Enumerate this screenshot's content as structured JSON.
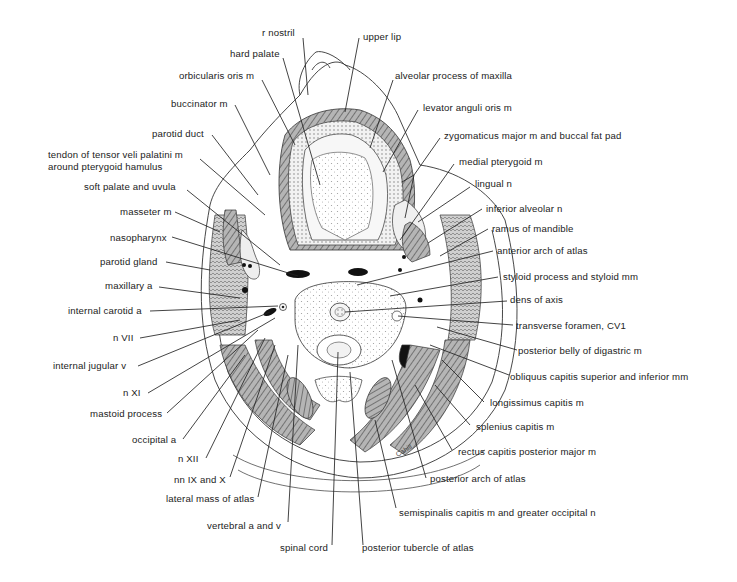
{
  "figure": {
    "signature": "Cahill",
    "colors": {
      "ink": "#222222",
      "background": "#ffffff",
      "muscle_shading": "#8a8a8a",
      "bone_stipple": "#bdbdbd"
    }
  },
  "labels": {
    "left": [
      {
        "text": "r nostril"
      },
      {
        "text": "hard palate"
      },
      {
        "text": "orbicularis oris m"
      },
      {
        "text": "buccinator m"
      },
      {
        "text": "parotid duct"
      },
      {
        "text": "tendon of tensor veli palatini m"
      },
      {
        "text": "around pterygoid hamulus"
      },
      {
        "text": "soft palate and uvula"
      },
      {
        "text": "masseter m"
      },
      {
        "text": "nasopharynx"
      },
      {
        "text": "parotid gland"
      },
      {
        "text": "maxillary a"
      },
      {
        "text": "internal carotid a"
      },
      {
        "text": "n VII"
      },
      {
        "text": "internal jugular v"
      },
      {
        "text": "n XI"
      },
      {
        "text": "mastoid process"
      },
      {
        "text": "occipital a"
      },
      {
        "text": "n XII"
      },
      {
        "text": "nn IX and X"
      },
      {
        "text": "lateral mass of atlas"
      },
      {
        "text": "vertebral a and v"
      },
      {
        "text": "spinal cord"
      }
    ],
    "right": [
      {
        "text": "upper lip"
      },
      {
        "text": "alveolar process of maxilla"
      },
      {
        "text": "levator anguli oris m"
      },
      {
        "text": "zygomaticus major m and buccal fat pad"
      },
      {
        "text": "medial pterygoid m"
      },
      {
        "text": "lingual n"
      },
      {
        "text": "inferior alveolar n"
      },
      {
        "text": "ramus of mandible"
      },
      {
        "text": "anterior arch of atlas"
      },
      {
        "text": "styloid process and styloid mm"
      },
      {
        "text": "dens of axis"
      },
      {
        "text": "transverse foramen, CV1"
      },
      {
        "text": "posterior belly of digastric m"
      },
      {
        "text": "obliquus capitis superior and inferior mm"
      },
      {
        "text": "longissimus capitis m"
      },
      {
        "text": "splenius capitis m"
      },
      {
        "text": "rectus capitis posterior major m"
      },
      {
        "text": "posterior arch of atlas"
      },
      {
        "text": "semispinalis capitis m and greater occipital n"
      },
      {
        "text": "posterior tubercle of atlas"
      }
    ]
  }
}
